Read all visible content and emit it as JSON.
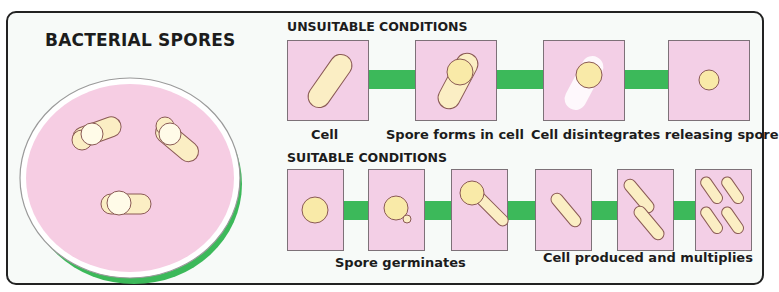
{
  "title": "BACTERIAL SPORES",
  "colors": {
    "background": "#f7faf8",
    "box_fill": "#f3cfe6",
    "connector_green": "#3cb95a",
    "cell_fill": "#fbeec4",
    "spore_fill": "#f9eaa8",
    "outline": "#8a5a55"
  },
  "dish": {
    "description": "Petri dish with spore-forming bacterial cells",
    "cell_count": 3
  },
  "unsuitable": {
    "heading": "UNSUITABLE CONDITIONS",
    "steps": [
      {
        "label": "Cell"
      },
      {
        "label": "Spore forms in cell"
      },
      {
        "label": "Cell disintegrates releasing spore"
      }
    ],
    "box_count": 4
  },
  "suitable": {
    "heading": "SUITABLE CONDITIONS",
    "steps": [
      {
        "label": "Spore germinates"
      },
      {
        "label": "Cell produced and multiplies"
      }
    ],
    "box_count": 6
  }
}
